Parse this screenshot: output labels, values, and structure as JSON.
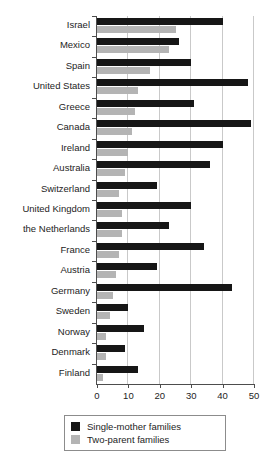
{
  "chart_data": {
    "type": "bar",
    "orientation": "horizontal",
    "title": "",
    "xlabel": "",
    "ylabel": "",
    "xlim": [
      0,
      50
    ],
    "xticks": [
      0,
      10,
      20,
      30,
      40,
      50
    ],
    "xtick_labels": [
      "0",
      "10",
      "20",
      "30",
      "40",
      "50"
    ],
    "grid": "vertical",
    "categories": [
      "Israel",
      "Mexico",
      "Spain",
      "United States",
      "Greece",
      "Canada",
      "Ireland",
      "Australia",
      "Switzerland",
      "United Kingdom",
      "the Netherlands",
      "France",
      "Austria",
      "Germany",
      "Sweden",
      "Norway",
      "Denmark",
      "Finland"
    ],
    "series": [
      {
        "name": "Single-mother families",
        "color": "#161616",
        "values": [
          40,
          26,
          30,
          48,
          31,
          49,
          40,
          36,
          19,
          30,
          23,
          34,
          19,
          43,
          10,
          15,
          9,
          13
        ]
      },
      {
        "name": "Two-parent families",
        "color": "#b4b4b4",
        "values": [
          25,
          23,
          17,
          13,
          12,
          11,
          10,
          9,
          7,
          8,
          8,
          7,
          6,
          5,
          4,
          3,
          3,
          2
        ]
      }
    ],
    "legend": {
      "position": "bottom",
      "entries": [
        {
          "label": "Single-mother families",
          "color": "#161616"
        },
        {
          "label": "Two-parent families",
          "color": "#b4b4b4"
        }
      ]
    }
  }
}
